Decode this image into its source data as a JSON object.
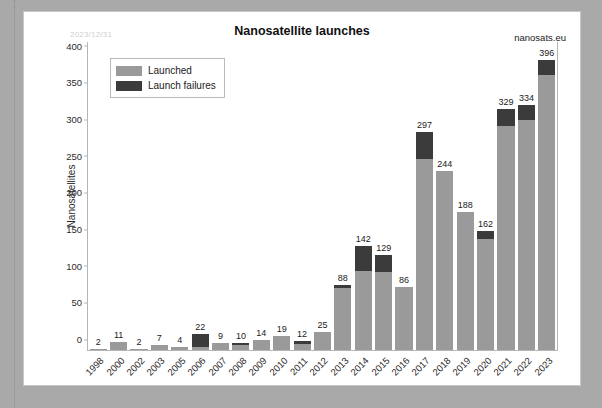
{
  "watermark": "nanosats.eu",
  "date_stamp": "2023/12/31",
  "colors": {
    "launched": "#9a9a9a",
    "failures": "#3b3b3b",
    "page_background": "#a9a9a9",
    "card_background": "#ffffff",
    "axis": "#b5b5b5"
  },
  "legend": {
    "position": "top-left",
    "items": [
      {
        "label": "Launched",
        "color": "#9a9a9a"
      },
      {
        "label": "Launch failures",
        "color": "#3b3b3b"
      }
    ]
  },
  "chart_data": {
    "type": "bar",
    "title": "Nanosatellite launches",
    "xlabel": "",
    "ylabel": "Nanosatellites",
    "ylim": [
      0,
      420
    ],
    "yticks": [
      0,
      50,
      100,
      150,
      200,
      250,
      300,
      350,
      400
    ],
    "grid": false,
    "stacked": true,
    "legend_position": "top-left",
    "categories": [
      "1998",
      "2000",
      "2002",
      "2003",
      "2005",
      "2006",
      "2007",
      "2008",
      "2009",
      "2010",
      "2011",
      "2012",
      "2013",
      "2014",
      "2015",
      "2016",
      "2017",
      "2018",
      "2019",
      "2020",
      "2021",
      "2022",
      "2023"
    ],
    "totals": [
      2,
      11,
      2,
      7,
      4,
      22,
      9,
      10,
      14,
      19,
      12,
      25,
      88,
      142,
      129,
      86,
      297,
      244,
      188,
      162,
      329,
      334,
      396
    ],
    "series": [
      {
        "name": "Launched",
        "values": [
          2,
          11,
          2,
          7,
          4,
          4,
          9,
          7,
          14,
          19,
          8,
          25,
          85,
          108,
          107,
          86,
          260,
          244,
          188,
          152,
          306,
          313,
          375
        ]
      },
      {
        "name": "Launch failures",
        "values": [
          0,
          0,
          0,
          0,
          0,
          18,
          0,
          3,
          0,
          0,
          4,
          0,
          3,
          34,
          22,
          0,
          37,
          0,
          0,
          10,
          23,
          21,
          21
        ]
      }
    ],
    "data_labels": [
      2,
      11,
      2,
      7,
      4,
      22,
      9,
      10,
      14,
      19,
      12,
      25,
      88,
      142,
      129,
      86,
      297,
      244,
      188,
      162,
      329,
      334,
      396
    ]
  }
}
